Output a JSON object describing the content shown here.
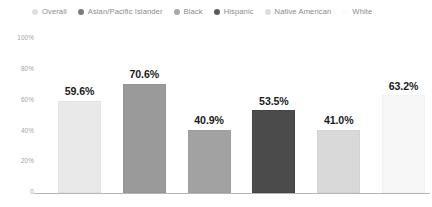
{
  "chart_data": {
    "type": "bar",
    "title": "",
    "subtitle": "",
    "xlabel": "",
    "ylabel": "",
    "categories": [
      "Overall",
      "Asian/Pacific Islander",
      "Black",
      "Hispanic",
      "Native American",
      "White"
    ],
    "values": [
      59.6,
      70.6,
      40.9,
      53.5,
      41.0,
      63.2
    ],
    "value_labels": [
      "59.6%",
      "70.6%",
      "40.9%",
      "53.5%",
      "41.0%",
      "63.2%"
    ],
    "ylim": [
      0,
      100
    ],
    "yticks": [
      100,
      80,
      60,
      40,
      20,
      0
    ],
    "ytick_labels": [
      "100%",
      "80%",
      "60%",
      "40%",
      "20%",
      "0"
    ],
    "grid": false,
    "legend_position": "top",
    "series_colors": [
      "#e9e9e9",
      "#9a9a9a",
      "#a2a2a2",
      "#4b4b4b",
      "#d9d9d9",
      "#f7f7f7"
    ],
    "bar_border_colors": [
      "#dcdcdc",
      "#8e8e8e",
      "#979797",
      "#3f3f3f",
      "#cdcdcd",
      "#ededed"
    ],
    "axis_color": "#b5b5b5",
    "value_label_color": "#1b1b1b",
    "tick_label_color": "#a3a3a3"
  },
  "legend": {
    "items": [
      {
        "label": "Overall",
        "color": "#e0e0e0"
      },
      {
        "label": "Asian/Pacific Islander",
        "color": "#7c7c7c"
      },
      {
        "label": "Black",
        "color": "#a8a8a8"
      },
      {
        "label": "Hispanic",
        "color": "#5a5a5a"
      },
      {
        "label": "Native American",
        "color": "#dcdcdc"
      },
      {
        "label": "White",
        "color": "#fbfbfb"
      }
    ]
  }
}
